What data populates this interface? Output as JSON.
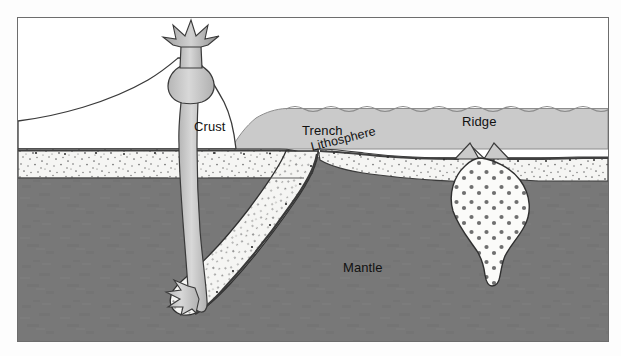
{
  "diagram": {
    "labels": [
      {
        "name": "crust",
        "text": "Crust",
        "x": 176,
        "y": 101
      },
      {
        "name": "trench",
        "text": "Trench",
        "x": 284,
        "y": 105
      },
      {
        "name": "ridge",
        "text": "Ridge",
        "x": 444,
        "y": 96
      },
      {
        "name": "lithosphere",
        "text": "Lithosphere",
        "x": 293,
        "y": 122
      },
      {
        "name": "mantle",
        "text": "Mantle",
        "x": 325,
        "y": 242
      }
    ],
    "features": [
      {
        "name": "volcano",
        "label": "erupting volcano"
      },
      {
        "name": "magma-conduit",
        "label": "magma conduit"
      },
      {
        "name": "magma-chamber",
        "label": "magma chamber"
      },
      {
        "name": "subducting-slab",
        "label": "subducting lithospheric slab"
      },
      {
        "name": "mid-ocean-ridge",
        "label": "mid-ocean ridge"
      },
      {
        "name": "ridge-magma-plume",
        "label": "rising magma plume"
      },
      {
        "name": "ocean-water",
        "label": "ocean water"
      },
      {
        "name": "continental-crust",
        "label": "continental crust mountain"
      }
    ],
    "colors": {
      "mantle": "#787878",
      "ocean_water": "#cacaca",
      "lithosphere": "#f4f4f2",
      "magma": "#c9c9c9",
      "outline": "#2b2b2b",
      "frame": "#6d6d6d",
      "background": "#ffffff",
      "stipple": "#6b6b6b",
      "plume_dot": "#6f6f6f"
    }
  }
}
